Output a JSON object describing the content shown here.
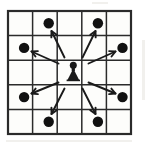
{
  "figure": {
    "caption": "",
    "board_rows": 5,
    "board_cols": 5
  },
  "colors": {
    "ink": "#1a1a1a",
    "board_line": "#2b2b2b",
    "board_fill": "#fdfdfb",
    "page_background": "#ffffff",
    "dot_fill": "#111111",
    "arrow_stroke": "#1a1a1a"
  },
  "board": {
    "origin_x": 8,
    "origin_y": 11,
    "cell_size": 24.6,
    "outer_stroke_width": 2.2,
    "inner_stroke_width": 1.5
  },
  "piece": {
    "name": "knight-piece",
    "label": "Knight",
    "row": 3,
    "col": 3,
    "center_x": 73.3,
    "center_y": 72.8
  },
  "chart_data": {
    "type": "scatter",
    "xlabel": "",
    "ylabel": "",
    "xlim": [
      1,
      5
    ],
    "ylim": [
      1,
      5
    ],
    "grid": true,
    "legend": "none",
    "categories": [
      "a",
      "b",
      "c",
      "d",
      "e"
    ],
    "series": [
      {
        "name": "Knight origin",
        "marker": "piece",
        "points": [
          {
            "col": 3,
            "row": 3
          }
        ]
      },
      {
        "name": "Legal destination squares",
        "marker": "filled-circle",
        "points": [
          {
            "col": 2,
            "row": 1
          },
          {
            "col": 4,
            "row": 1
          },
          {
            "col": 1,
            "row": 2
          },
          {
            "col": 5,
            "row": 2
          },
          {
            "col": 1,
            "row": 4
          },
          {
            "col": 5,
            "row": 4
          },
          {
            "col": 2,
            "row": 5
          },
          {
            "col": 4,
            "row": 5
          }
        ]
      }
    ],
    "annotations": [
      {
        "type": "arrow",
        "from": {
          "col": 3,
          "row": 3
        },
        "to": {
          "col": 2,
          "row": 1
        }
      },
      {
        "type": "arrow",
        "from": {
          "col": 3,
          "row": 3
        },
        "to": {
          "col": 4,
          "row": 1
        }
      },
      {
        "type": "arrow",
        "from": {
          "col": 3,
          "row": 3
        },
        "to": {
          "col": 1,
          "row": 2
        }
      },
      {
        "type": "arrow",
        "from": {
          "col": 3,
          "row": 3
        },
        "to": {
          "col": 5,
          "row": 2
        }
      },
      {
        "type": "arrow",
        "from": {
          "col": 3,
          "row": 3
        },
        "to": {
          "col": 1,
          "row": 4
        }
      },
      {
        "type": "arrow",
        "from": {
          "col": 3,
          "row": 3
        },
        "to": {
          "col": 5,
          "row": 4
        }
      },
      {
        "type": "arrow",
        "from": {
          "col": 3,
          "row": 3
        },
        "to": {
          "col": 2,
          "row": 5
        }
      },
      {
        "type": "arrow",
        "from": {
          "col": 3,
          "row": 3
        },
        "to": {
          "col": 4,
          "row": 5
        }
      }
    ]
  },
  "dots": [
    {
      "name": "dot-r1c2",
      "cx": 48.7,
      "cy": 23.3,
      "r": 5.2
    },
    {
      "name": "dot-r1c4",
      "cx": 97.9,
      "cy": 23.3,
      "r": 5.2
    },
    {
      "name": "dot-r2c1",
      "cx": 24.1,
      "cy": 47.9,
      "r": 5.2
    },
    {
      "name": "dot-r2c5",
      "cx": 122.5,
      "cy": 47.9,
      "r": 5.2
    },
    {
      "name": "dot-r4c1",
      "cx": 24.1,
      "cy": 97.1,
      "r": 5.2
    },
    {
      "name": "dot-r4c5",
      "cx": 122.5,
      "cy": 97.1,
      "r": 5.2
    },
    {
      "name": "dot-r5c2",
      "cx": 48.7,
      "cy": 121.7,
      "r": 5.2
    },
    {
      "name": "dot-r5c4",
      "cx": 97.9,
      "cy": 121.7,
      "r": 5.2
    }
  ],
  "arrows": [
    {
      "name": "arrow-to-r1c2",
      "x1": 64.5,
      "y1": 57.5,
      "x2": 51.5,
      "y2": 31.0
    },
    {
      "name": "arrow-to-r1c4",
      "x1": 82.5,
      "y1": 57.5,
      "x2": 95.5,
      "y2": 31.0
    },
    {
      "name": "arrow-to-r2c1",
      "x1": 58.5,
      "y1": 63.5,
      "x2": 31.5,
      "y2": 51.5
    },
    {
      "name": "arrow-to-r2c5",
      "x1": 88.5,
      "y1": 63.5,
      "x2": 115.5,
      "y2": 51.5
    },
    {
      "name": "arrow-to-r4c1",
      "x1": 58.5,
      "y1": 82.5,
      "x2": 31.5,
      "y2": 93.5
    },
    {
      "name": "arrow-to-r4c5",
      "x1": 88.5,
      "y1": 82.5,
      "x2": 115.5,
      "y2": 93.5
    },
    {
      "name": "arrow-to-r5c2",
      "x1": 64.5,
      "y1": 88.5,
      "x2": 51.5,
      "y2": 114.0
    },
    {
      "name": "arrow-to-r5c4",
      "x1": 82.5,
      "y1": 88.5,
      "x2": 95.5,
      "y2": 114.0
    }
  ],
  "grid_lines": {
    "verticals": [
      8,
      32.6,
      57.2,
      81.8,
      106.4,
      131
    ],
    "horizontals": [
      11,
      35.6,
      60.2,
      84.8,
      109.4,
      134
    ]
  }
}
